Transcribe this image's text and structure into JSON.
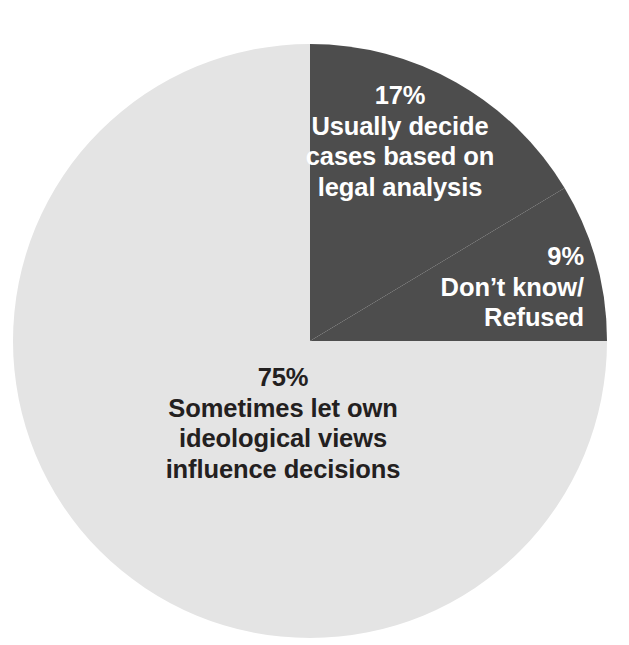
{
  "chart_data": {
    "type": "pie",
    "title": "",
    "subtitle": "",
    "xlabel": "",
    "ylabel": "",
    "legend_position": "none",
    "grid": false,
    "value_unit": "percent",
    "categories": [
      "Sometimes let own ideological views influence decisions",
      "Usually decide cases based on legal analysis",
      "Don't know/ Refused"
    ],
    "values": [
      75,
      17,
      9
    ],
    "slices": [
      {
        "label": "Sometimes let own ideological views influence decisions",
        "value": 75,
        "value_text": "75%",
        "color": "#e4e4e4",
        "text_color": "#232020",
        "lines": [
          "Sometimes let own",
          "ideological views",
          "influence decisions"
        ],
        "start_angle_deg": 90,
        "end_angle_deg": 360
      },
      {
        "label": "Usually decide cases based on legal analysis",
        "value": 17,
        "value_text": "17%",
        "color": "#4d4d4d",
        "text_color": "#ffffff",
        "lines": [
          "Usually decide",
          "cases based on",
          "legal analysis"
        ],
        "start_angle_deg": 0,
        "end_angle_deg": 59
      },
      {
        "label": "Don't know/ Refused",
        "value": 9,
        "value_text": "9%",
        "color": "#4d4d4d",
        "text_color": "#ffffff",
        "lines": [
          "Don’t know/",
          "Refused"
        ],
        "start_angle_deg": 59,
        "end_angle_deg": 90
      }
    ]
  },
  "labels": {
    "legal_analysis": {
      "percent": "17%",
      "line1": "Usually decide",
      "line2": "cases based on",
      "line3": "legal analysis"
    },
    "dont_know": {
      "percent": "9%",
      "line1": "Don’t know/",
      "line2": "Refused"
    },
    "ideological": {
      "percent": "75%",
      "line1": "Sometimes let own",
      "line2": "ideological views",
      "line3": "influence decisions"
    }
  },
  "colors": {
    "dark_slice": "#4d4d4d",
    "light_slice": "#e4e4e4",
    "background": "#ffffff",
    "dark_text": "#232020",
    "light_text": "#ffffff"
  },
  "geometry": {
    "center_x": 310,
    "center_y": 341,
    "radius": 297
  }
}
